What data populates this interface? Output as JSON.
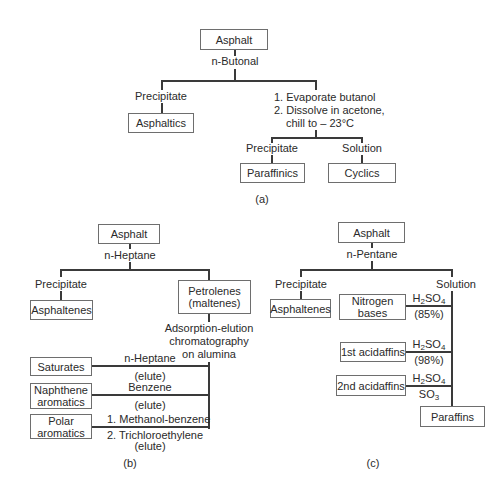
{
  "panel_a": {
    "caption": "(a)",
    "root": "Asphalt",
    "solvent": "n-Butonal",
    "left_branch": "Precipitate",
    "left_product": "Asphaltics",
    "right_steps": [
      "1. Evaporate butanol",
      "2. Dissolve in acetone,",
      "chill to – 23°C"
    ],
    "sub_left_branch": "Precipitate",
    "sub_right_branch": "Solution",
    "sub_left_product": "Paraffinics",
    "sub_right_product": "Cyclics"
  },
  "panel_b": {
    "caption": "(b)",
    "root": "Asphalt",
    "solvent": "n-Heptane",
    "left_branch": "Precipitate",
    "left_product": "Asphaltenes",
    "right_product_line1": "Petrolenes",
    "right_product_line2": "(maltenes)",
    "method": [
      "Adsorption-elution",
      "chromatography",
      "on alumina"
    ],
    "fractions": [
      {
        "name_line1": "Saturates",
        "name_line2": "",
        "eluent_above": "n-Heptane",
        "eluent_below": "(elute)"
      },
      {
        "name_line1": "Naphthene",
        "name_line2": "aromatics",
        "eluent_above": "Benzene",
        "eluent_below": "(elute)"
      },
      {
        "name_line1": "Polar",
        "name_line2": "aromatics",
        "eluent_above": "1. Methanol-benzene",
        "eluent_below": "2. Trichloroethylene",
        "eluent_below2": "(elute)"
      }
    ]
  },
  "panel_c": {
    "caption": "(c)",
    "root": "Asphalt",
    "solvent": "n-Pentane",
    "left_branch": "Precipitate",
    "right_branch": "Solution",
    "left_product": "Asphaltenes",
    "fractions": [
      {
        "name_line1": "Nitrogen",
        "name_line2": "bases",
        "reagent_main": "H",
        "reagent_sub": "2",
        "reagent_rest": "SO",
        "reagent_sub2": "4",
        "reagent_below": "(85%)"
      },
      {
        "name_line1": "1st acidaffins",
        "reagent_main": "H",
        "reagent_sub": "2",
        "reagent_rest": "SO",
        "reagent_sub2": "4",
        "reagent_below": "(98%)"
      },
      {
        "name_line1": "2nd acidaffins",
        "reagent_main": "H",
        "reagent_sub": "2",
        "reagent_rest": "SO",
        "reagent_sub2": "4",
        "reagent_below_main": "SO",
        "reagent_below_sub": "3"
      }
    ],
    "final_product": "Paraffins"
  },
  "colors": {
    "line": "#3a3a3a",
    "box_border": "#6e6e6e",
    "text": "#2a2a2a",
    "background": "#ffffff"
  }
}
